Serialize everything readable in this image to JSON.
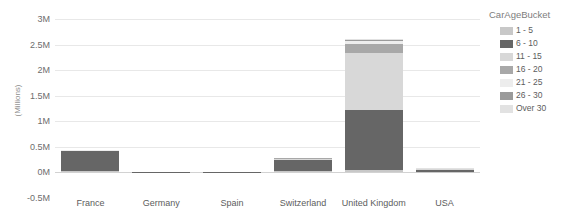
{
  "chart_data": {
    "type": "bar",
    "subtype": "stacked-bar",
    "title": "",
    "xlabel": "",
    "ylabel": "(Millions)",
    "ylim": [
      -0.5,
      3
    ],
    "ytick_labels": [
      "3M",
      "2.5M",
      "2M",
      "1.5M",
      "1M",
      "0.5M",
      "0M",
      "-0.5M"
    ],
    "ytick_values": [
      3,
      2.5,
      2,
      1.5,
      1,
      0.5,
      0,
      -0.5
    ],
    "grid": true,
    "legend_position": "right",
    "legend_title": "CarAgeBucket",
    "categories": [
      "France",
      "Germany",
      "Spain",
      "Switzerland",
      "United Kingdom",
      "USA"
    ],
    "series": [
      {
        "name": "1 - 5",
        "color": "#c8c8c8",
        "values": [
          0.015,
          0.001,
          0.001,
          0.012,
          0.03,
          0.004
        ]
      },
      {
        "name": "6 - 10",
        "color": "#666666",
        "values": [
          0.39,
          0.008,
          0.006,
          0.23,
          1.18,
          0.03
        ]
      },
      {
        "name": "11 - 15",
        "color": "#d8d8d8",
        "values": [
          0.01,
          0.001,
          0.001,
          0.02,
          1.12,
          0.02
        ]
      },
      {
        "name": "16 - 20",
        "color": "#a8a8a8",
        "values": [
          0.006,
          0.0,
          0.0,
          0.008,
          0.18,
          0.008
        ]
      },
      {
        "name": "21 - 25",
        "color": "#ededed",
        "values": [
          0.004,
          0.0,
          0.0,
          0.004,
          0.05,
          0.004
        ]
      },
      {
        "name": "26 - 30",
        "color": "#9a9a9a",
        "values": [
          0.003,
          0.0,
          0.0,
          0.003,
          0.02,
          0.002
        ]
      },
      {
        "name": "Over 30",
        "color": "#e2e2e2",
        "values": [
          0.002,
          0.0,
          0.0,
          0.003,
          0.02,
          0.002
        ]
      }
    ],
    "totals": [
      0.43,
      0.01,
      0.008,
      0.28,
      2.6,
      0.07
    ]
  },
  "legend": {
    "title": "CarAgeBucket",
    "items": [
      {
        "label": "1 - 5",
        "color": "#c8c8c8"
      },
      {
        "label": "6 - 10",
        "color": "#666666"
      },
      {
        "label": "11 - 15",
        "color": "#d8d8d8"
      },
      {
        "label": "16 - 20",
        "color": "#a8a8a8"
      },
      {
        "label": "21 - 25",
        "color": "#ededed"
      },
      {
        "label": "26 - 30",
        "color": "#9a9a9a"
      },
      {
        "label": "Over 30",
        "color": "#e2e2e2"
      }
    ]
  },
  "axes": {
    "y_title": "(Millions)",
    "y_ticks": [
      "3M",
      "2.5M",
      "2M",
      "1.5M",
      "1M",
      "0.5M",
      "0M",
      "-0.5M"
    ],
    "x_ticks": [
      "France",
      "Germany",
      "Spain",
      "Switzerland",
      "United Kingdom",
      "USA"
    ]
  },
  "colors": {
    "gridline": "#e8e8e8",
    "axis_line": "#d2d2d2",
    "tick_text": "#6d6d6d",
    "background": "#ffffff"
  }
}
